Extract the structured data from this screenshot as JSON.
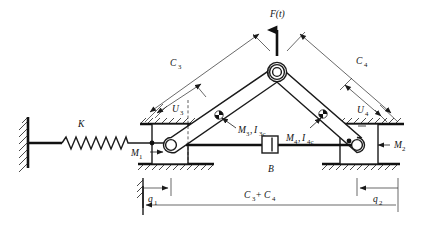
{
  "figure": {
    "type": "mechanical-schematic",
    "background_color": "#ffffff",
    "line_color": "#111111",
    "width": 444,
    "height": 229
  },
  "labels": {
    "force": {
      "text": "F(t)",
      "name": "applied-force",
      "x": 278,
      "y": 16
    },
    "spring": {
      "text": "K",
      "name": "spring-constant",
      "x": 82,
      "y": 126
    },
    "mass_left": {
      "base": "M",
      "sub": "1",
      "name": "left-slider-mass",
      "x": 139,
      "y": 155
    },
    "mass_right": {
      "base": "M",
      "sub": "2",
      "name": "right-slider-mass",
      "x": 394,
      "y": 146
    },
    "link3": {
      "mass": {
        "base": "M",
        "sub": "3"
      },
      "inertia": {
        "base": "I",
        "sub": "3c"
      },
      "text": "M3 , I3c",
      "name": "link3-mass-inertia",
      "x": 240,
      "y": 130
    },
    "link4": {
      "mass": {
        "base": "M",
        "sub": "4"
      },
      "inertia": {
        "base": "I",
        "sub": "4c"
      },
      "text": "M4 , I4c",
      "name": "link4-mass-inertia",
      "x": 291,
      "y": 138
    },
    "damper": {
      "text": "B",
      "name": "damper-label",
      "x": 272,
      "y": 170
    },
    "c3": {
      "base": "C",
      "sub": "3",
      "name": "dimension-c3",
      "x": 176,
      "y": 62
    },
    "c4": {
      "base": "C",
      "sub": "4",
      "name": "dimension-c4",
      "x": 362,
      "y": 60
    },
    "u3": {
      "base": "U",
      "sub": "3",
      "name": "dimension-u3",
      "x": 178,
      "y": 109
    },
    "u4": {
      "base": "U",
      "sub": "4",
      "name": "dimension-u4",
      "x": 363,
      "y": 110
    },
    "q1": {
      "base": "q",
      "sub": "1",
      "name": "dimension-q1",
      "x": 145,
      "y": 199
    },
    "q2": {
      "base": "q",
      "sub": "2",
      "name": "dimension-q2",
      "x": 377,
      "y": 199
    },
    "span": {
      "text": "C3+C4",
      "name": "dimension-total-span",
      "x": 258,
      "y": 196
    }
  },
  "geometry": {
    "apex_joint": {
      "x": 277,
      "y": 72,
      "name": "apex-pin-joint"
    },
    "left_pin": {
      "x": 171,
      "y": 145,
      "name": "left-slider-pin"
    },
    "right_pin": {
      "x": 357,
      "y": 145,
      "name": "right-slider-pin"
    },
    "wall_x": 24,
    "rail_y_top": 122,
    "rail_y_bottom": 163,
    "base_line_y": 145
  },
  "components": [
    {
      "name": "fixed-wall",
      "kind": "ground-wall"
    },
    {
      "name": "coil-spring",
      "kind": "spring",
      "coils": 11
    },
    {
      "name": "left-slider-block",
      "kind": "prismatic-slider"
    },
    {
      "name": "right-slider-block",
      "kind": "prismatic-slider"
    },
    {
      "name": "link-c3",
      "kind": "rigid-link"
    },
    {
      "name": "link-c4",
      "kind": "rigid-link"
    },
    {
      "name": "apex-revolute-joint",
      "kind": "pin-joint"
    },
    {
      "name": "viscous-damper",
      "kind": "dashpot"
    },
    {
      "name": "center-of-mass-marker-link3",
      "kind": "cg-marker"
    },
    {
      "name": "center-of-mass-marker-link4",
      "kind": "cg-marker"
    },
    {
      "name": "ground-hatching",
      "kind": "hatch"
    }
  ]
}
